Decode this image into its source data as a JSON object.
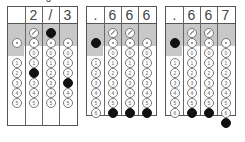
{
  "caption_fragment": "3",
  "grids": [
    {
      "answer": "2/3",
      "header": [
        "",
        "2",
        "/",
        "3"
      ],
      "filled": {
        "slash_col": 2,
        "digits": [
          {
            "col": 1,
            "digit": 2
          },
          {
            "col": 3,
            "digit": 3
          }
        ]
      }
    },
    {
      "answer": ".666",
      "header": [
        ".",
        "6",
        "6",
        "6"
      ],
      "filled": {
        "decimal_col": 0,
        "digits": [
          {
            "col": 1,
            "digit": 6
          },
          {
            "col": 2,
            "digit": 6
          },
          {
            "col": 3,
            "digit": 6
          }
        ]
      }
    },
    {
      "answer": ".667",
      "header": [
        ".",
        "6",
        "6",
        "7"
      ],
      "filled": {
        "decimal_col": 0,
        "digits": [
          {
            "col": 1,
            "digit": 6
          },
          {
            "col": 2,
            "digit": 6
          },
          {
            "col": 3,
            "digit": 7
          }
        ]
      }
    }
  ],
  "bubble_labels": [
    "0",
    "1",
    "2",
    "3",
    "4",
    "5",
    "6",
    "7"
  ],
  "colors": {
    "gray_band": "#c8c8c8",
    "border": "#555555",
    "fill": "#111111"
  }
}
